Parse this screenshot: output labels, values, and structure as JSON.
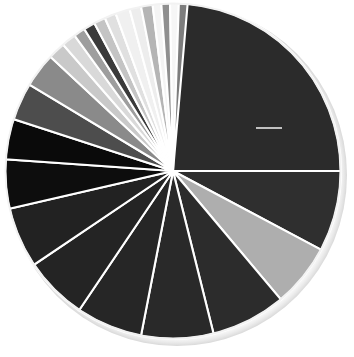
{
  "chart_data": {
    "type": "pie",
    "title": "",
    "subtitle": "",
    "xlabel": "",
    "ylabel": "",
    "legend_position": "none",
    "grid": false,
    "start_angle_deg": 0,
    "direction": "clockwise",
    "center": {
      "x": 173,
      "y": 171
    },
    "radius": 168,
    "total": 100,
    "labels": [
      "Slice 1",
      "Slice 2",
      "Slice 3",
      "Slice 4",
      "Slice 5",
      "Slice 6",
      "Slice 7",
      "Slice 8",
      "Slice 9",
      "Slice 10",
      "Slice 11",
      "Slice 12",
      "Slice 13",
      "Slice 14",
      "Slice 15",
      "Slice 16",
      "Slice 17",
      "Slice 18",
      "Slice 19",
      "Slice 20",
      "Slice 21",
      "Slice 22",
      "Slice 23",
      "Slice 24",
      "Slice 25"
    ],
    "values": [
      25.0,
      7.8,
      6.1,
      7.2,
      6.9,
      6.4,
      6.1,
      5.8,
      4.7,
      3.9,
      3.6,
      3.3,
      1.7,
      1.4,
      1.1,
      1.1,
      1.1,
      1.1,
      1.4,
      1.1,
      1.1,
      0.8,
      0.8,
      0.8,
      0.8
    ],
    "angles_deg": [
      90.0,
      28.0,
      22.0,
      26.0,
      25.0,
      23.0,
      22.0,
      21.0,
      17.0,
      14.0,
      13.0,
      12.0,
      6.0,
      5.0,
      4.0,
      4.0,
      4.0,
      4.0,
      5.0,
      4.0,
      4.0,
      3.0,
      3.0,
      3.0,
      3.0
    ],
    "colors": [
      "#2b2b2b",
      "#2f2f2f",
      "#aeaeae",
      "#2c2c2c",
      "#292929",
      "#262626",
      "#242424",
      "#222222",
      "#0d0d0d",
      "#0a0a0a",
      "#4d4d4d",
      "#8a8a8a",
      "#c9c9c9",
      "#d9d9d9",
      "#9e9e9e",
      "#3a3a3a",
      "#c4c4c4",
      "#e0e0e0",
      "#f0f0f0",
      "#ededed",
      "#b5b5b5",
      "#f4f4f4",
      "#8f8f8f",
      "#f6f6f6",
      "#7d7d7d"
    ],
    "annotations": [
      {
        "name": "leader-line",
        "type": "line",
        "x1": 256,
        "y1": 128,
        "x2": 282,
        "y2": 128,
        "color": "#e8e8e8"
      }
    ]
  }
}
